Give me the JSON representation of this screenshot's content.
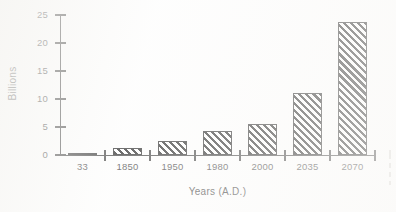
{
  "chart_data": {
    "type": "bar",
    "title": "",
    "xlabel": "Years (A.D.)",
    "ylabel": "Billions",
    "categories": [
      "33",
      "1850",
      "1950",
      "1980",
      "2000",
      "2035",
      "2070"
    ],
    "values": [
      0.25,
      1.2,
      2.5,
      4.3,
      5.6,
      11,
      23.8
    ],
    "ylim": [
      0,
      25
    ],
    "yticks": [
      0,
      5,
      10,
      15,
      20,
      25
    ],
    "ytick_labels": [
      "0",
      "5",
      "10",
      "15",
      "20",
      "25"
    ],
    "grid": false,
    "legend": null,
    "series": [
      {
        "name": "World population",
        "values": [
          0.25,
          1.2,
          2.5,
          4.3,
          5.6,
          11,
          23.8
        ]
      }
    ],
    "bar_style": "diagonal-hatch-black-on-white",
    "annotations": []
  },
  "axes": {
    "y_title": "Billions",
    "x_title": "Years (A.D.)"
  }
}
